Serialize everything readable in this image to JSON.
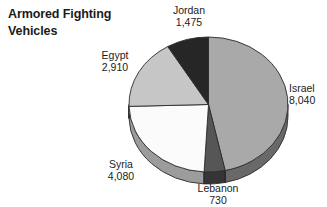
{
  "title": "Armored Fighting\nVehicles",
  "chart_data": {
    "type": "pie",
    "title": "Armored Fighting Vehicles",
    "subtitle": "",
    "xlabel": "",
    "ylabel": "",
    "grid": false,
    "legend_position": "none",
    "label_style": "outside-callout",
    "three_d": true,
    "start_angle_deg": 0,
    "direction": "clockwise",
    "total": 17235,
    "categories": [
      "Israel",
      "Lebanon",
      "Syria",
      "Egypt",
      "Jordan"
    ],
    "values": [
      8040,
      730,
      4080,
      2910,
      1475
    ],
    "value_labels": [
      "8,040",
      "730",
      "4,080",
      "2,910",
      "1,475"
    ],
    "colors": [
      "#a9a9a9",
      "#565656",
      "#fbfbfb",
      "#c6c6c6",
      "#262626"
    ],
    "slices": [
      {
        "name": "Israel",
        "value": 8040,
        "value_label": "8,040",
        "color": "#a9a9a9",
        "percent": 46.6,
        "angle_deg": 167.9
      },
      {
        "name": "Lebanon",
        "value": 730,
        "value_label": "730",
        "color": "#565656",
        "percent": 4.2,
        "angle_deg": 15.3
      },
      {
        "name": "Syria",
        "value": 4080,
        "value_label": "4,080",
        "color": "#fbfbfb",
        "percent": 23.7,
        "angle_deg": 85.2
      },
      {
        "name": "Egypt",
        "value": 2910,
        "value_label": "2,910",
        "color": "#c6c6c6",
        "percent": 16.9,
        "angle_deg": 60.8
      },
      {
        "name": "Jordan",
        "value": 1475,
        "value_label": "1,475",
        "color": "#262626",
        "percent": 8.6,
        "angle_deg": 30.8
      }
    ]
  },
  "labels": {
    "israel": {
      "name": "Israel",
      "value": "8,040"
    },
    "lebanon": {
      "name": "Lebanon",
      "value": "730"
    },
    "syria": {
      "name": "Syria",
      "value": "4,080"
    },
    "egypt": {
      "name": "Egypt",
      "value": "2,910"
    },
    "jordan": {
      "name": "Jordan",
      "value": "1,475"
    }
  },
  "colors": {
    "background": "#ffffff",
    "text": "#1b1b1b",
    "israel": "#a9a9a9",
    "lebanon": "#565656",
    "syria": "#fbfbfb",
    "egypt": "#c6c6c6",
    "jordan": "#262626",
    "outline": "#2b2b2b"
  }
}
